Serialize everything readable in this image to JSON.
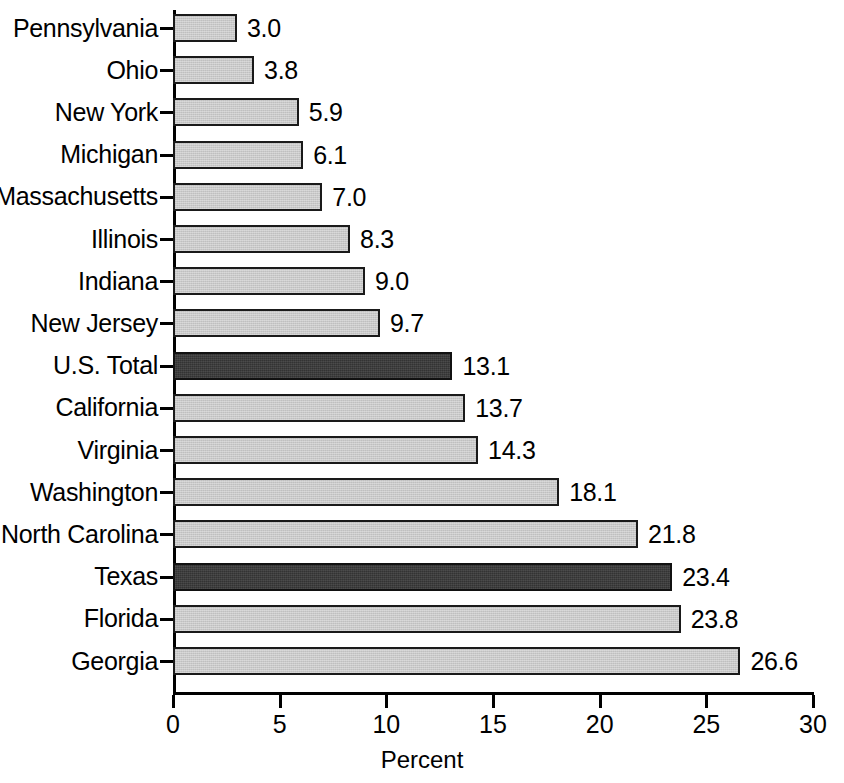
{
  "chart_data": {
    "type": "bar",
    "orientation": "horizontal",
    "title": "",
    "subtitle": "",
    "xlabel": "Percent",
    "ylabel": "",
    "xlim": [
      0,
      30
    ],
    "xticks": [
      0,
      5,
      10,
      15,
      20,
      25,
      30
    ],
    "xtick_labels": [
      "0",
      "5",
      "10",
      "15",
      "20",
      "25",
      "30"
    ],
    "grid": false,
    "legend": "none",
    "categories": [
      "Pennsylvania",
      "Ohio",
      "New York",
      "Michigan",
      "Massachusetts",
      "Illinois",
      "Indiana",
      "New Jersey",
      "U.S. Total",
      "California",
      "Virginia",
      "Washington",
      "North Carolina",
      "Texas",
      "Florida",
      "Georgia"
    ],
    "values": [
      3.0,
      3.8,
      5.9,
      6.1,
      7.0,
      8.3,
      9.0,
      9.7,
      13.1,
      13.7,
      14.3,
      18.1,
      21.8,
      23.4,
      23.8,
      26.6
    ],
    "value_labels": [
      "3.0",
      "3.8",
      "5.9",
      "6.1",
      "7.0",
      "8.3",
      "9.0",
      "9.7",
      "13.1",
      "13.7",
      "14.3",
      "18.1",
      "21.8",
      "23.4",
      "23.8",
      "26.6"
    ],
    "highlighted": [
      "U.S. Total",
      "Texas"
    ],
    "colors": {
      "bar_fill": "#c9c9c9",
      "bar_highlight_fill": "#333333",
      "bar_outline": "#1a1a1a",
      "axis": "#000000",
      "text": "#000000",
      "background": "#ffffff"
    }
  }
}
